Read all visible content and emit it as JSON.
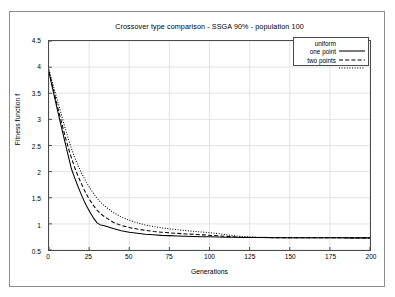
{
  "chart_data": {
    "type": "line",
    "title": "Crossover type comparison - SSGA 90% - population 100",
    "xlabel": "Generations",
    "ylabel": "Fitness function f",
    "xlim": [
      0,
      200
    ],
    "ylim": [
      0.5,
      4.5
    ],
    "xticks": [
      0,
      25,
      50,
      75,
      100,
      125,
      150,
      175,
      200
    ],
    "yticks": [
      0.5,
      1,
      1.5,
      2,
      2.5,
      3,
      3.5,
      4,
      4.5
    ],
    "xtick_labels": [
      "0",
      "25",
      "50",
      "75",
      "100",
      "125",
      "150",
      "175",
      "200"
    ],
    "ytick_labels": [
      "0.5",
      "1",
      "1.5",
      "2",
      "2.5",
      "3",
      "3.5",
      "4",
      "4.5"
    ],
    "grid": true,
    "legend_position": "top-right",
    "x": [
      0,
      2,
      4,
      6,
      8,
      10,
      12,
      14,
      16,
      18,
      20,
      22,
      24,
      26,
      28,
      30,
      32,
      34,
      36,
      38,
      40,
      45,
      50,
      55,
      60,
      65,
      70,
      75,
      80,
      85,
      90,
      95,
      100,
      105,
      110,
      115,
      120,
      130,
      140,
      150,
      160,
      170,
      180,
      190,
      200
    ],
    "series": [
      {
        "name": "uniform",
        "style": "solid",
        "color": "#000000",
        "values": [
          3.9,
          3.62,
          3.35,
          3.08,
          2.82,
          2.56,
          2.3,
          2.05,
          1.88,
          1.72,
          1.57,
          1.43,
          1.31,
          1.2,
          1.1,
          1.02,
          0.98,
          0.97,
          0.95,
          0.93,
          0.91,
          0.87,
          0.84,
          0.82,
          0.8,
          0.79,
          0.78,
          0.775,
          0.77,
          0.765,
          0.76,
          0.755,
          0.752,
          0.748,
          0.745,
          0.742,
          0.74,
          0.738,
          0.736,
          0.735,
          0.734,
          0.733,
          0.733,
          0.732,
          0.732
        ]
      },
      {
        "name": "one point",
        "style": "dashed",
        "color": "#000000",
        "values": [
          3.92,
          3.66,
          3.41,
          3.16,
          2.92,
          2.68,
          2.46,
          2.26,
          2.08,
          1.92,
          1.78,
          1.65,
          1.53,
          1.43,
          1.34,
          1.26,
          1.2,
          1.15,
          1.11,
          1.07,
          1.03,
          0.97,
          0.93,
          0.9,
          0.875,
          0.855,
          0.84,
          0.828,
          0.818,
          0.808,
          0.8,
          0.79,
          0.782,
          0.772,
          0.762,
          0.752,
          0.745,
          0.74,
          0.737,
          0.735,
          0.734,
          0.733,
          0.733,
          0.732,
          0.732
        ]
      },
      {
        "name": "two points",
        "style": "dotted",
        "color": "#000000",
        "values": [
          3.95,
          3.72,
          3.5,
          3.28,
          3.06,
          2.84,
          2.63,
          2.44,
          2.27,
          2.12,
          1.99,
          1.87,
          1.76,
          1.66,
          1.57,
          1.49,
          1.42,
          1.36,
          1.31,
          1.26,
          1.22,
          1.13,
          1.07,
          1.02,
          0.98,
          0.95,
          0.925,
          0.905,
          0.888,
          0.872,
          0.858,
          0.845,
          0.832,
          0.815,
          0.795,
          0.775,
          0.76,
          0.745,
          0.739,
          0.736,
          0.734,
          0.733,
          0.733,
          0.732,
          0.732
        ]
      }
    ],
    "legend": [
      {
        "label": "uniform",
        "style": "solid"
      },
      {
        "label": "one point",
        "style": "dashed"
      },
      {
        "label": "two points",
        "style": "dotted"
      }
    ]
  },
  "colors": {
    "frame": "#4a4a4a",
    "outer_frame": "#8d8d8d",
    "grid": "#e3e3e3",
    "line": "#000000",
    "background": "#ffffff"
  }
}
